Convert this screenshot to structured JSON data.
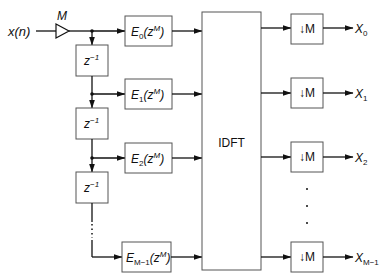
{
  "diagram": {
    "type": "polyphase DFT analysis filter bank",
    "input": {
      "label": "x(n)",
      "gain_label": "M"
    },
    "delay_label": "z",
    "delay_exp": "−1",
    "filters": [
      {
        "name": "E",
        "sub": "0",
        "arg": "(z",
        "exp": "M",
        "close": ")"
      },
      {
        "name": "E",
        "sub": "1",
        "arg": "(z",
        "exp": "M",
        "close": ")"
      },
      {
        "name": "E",
        "sub": "2",
        "arg": "(z",
        "exp": "M",
        "close": ")"
      },
      {
        "name": "E",
        "sub": "M−1",
        "arg": "(z",
        "exp": "M",
        "close": ")"
      }
    ],
    "transform": {
      "label": "IDFT"
    },
    "decimators": [
      {
        "label": "↓M"
      },
      {
        "label": "↓M"
      },
      {
        "label": "↓M"
      },
      {
        "label": "↓M"
      }
    ],
    "outputs": [
      {
        "name": "X",
        "sub": "0"
      },
      {
        "name": "X",
        "sub": "1"
      },
      {
        "name": "X",
        "sub": "2"
      },
      {
        "name": "X",
        "sub": "M−1"
      }
    ],
    "ellipsis": "⋮"
  },
  "colors": {
    "line": "#111111",
    "box_border": "#555555",
    "background": "#ffffff"
  }
}
